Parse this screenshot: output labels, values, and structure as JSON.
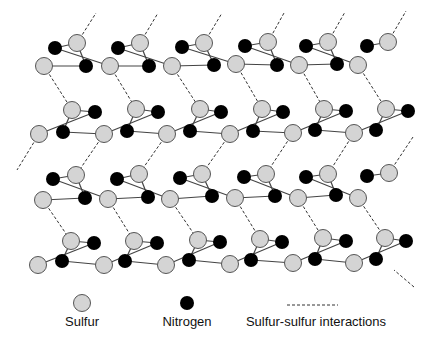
{
  "diagram": {
    "type": "molecular-lattice",
    "colors": {
      "sulfur_fill": "#d4d4d4",
      "sulfur_stroke": "#555555",
      "nitrogen_fill": "#000000",
      "bond": "#444444",
      "interaction": "#333333"
    },
    "radius": {
      "sulfur": 8.5,
      "nitrogen": 7
    },
    "rows": [
      {
        "s_top": [
          [
            77,
            43
          ],
          [
            140,
            43
          ],
          [
            204,
            43
          ],
          [
            268,
            42
          ],
          [
            328,
            42
          ],
          [
            388,
            42
          ]
        ],
        "n_top": [
          [
            55,
            48
          ],
          [
            118,
            48
          ],
          [
            182,
            47
          ],
          [
            245,
            46
          ],
          [
            306,
            46
          ],
          [
            367,
            46
          ]
        ],
        "s_bottom": [
          [
            44,
            66
          ],
          [
            110,
            66
          ],
          [
            172,
            66
          ],
          [
            236,
            64
          ],
          [
            299,
            65
          ],
          [
            358,
            65
          ]
        ],
        "n_bottom": [
          [
            86,
            66
          ],
          [
            149,
            66
          ],
          [
            214,
            65
          ],
          [
            277,
            65
          ],
          [
            337,
            64
          ]
        ]
      },
      {
        "s_top": [
          [
            72,
            110
          ],
          [
            136,
            109
          ],
          [
            200,
            109
          ],
          [
            262,
            109
          ],
          [
            324,
            109
          ],
          [
            386,
            109
          ]
        ],
        "n_top": [
          [
            95,
            112
          ],
          [
            158,
            112
          ],
          [
            221,
            112
          ],
          [
            283,
            112
          ],
          [
            346,
            111
          ],
          [
            408,
            111
          ]
        ],
        "s_bottom": [
          [
            39,
            134
          ],
          [
            104,
            134
          ],
          [
            167,
            134
          ],
          [
            230,
            134
          ],
          [
            293,
            133
          ],
          [
            354,
            133
          ]
        ],
        "n_bottom": [
          [
            63,
            132
          ],
          [
            127,
            131
          ],
          [
            190,
            131
          ],
          [
            253,
            131
          ],
          [
            315,
            130
          ],
          [
            376,
            130
          ]
        ]
      },
      {
        "s_top": [
          [
            76,
            175
          ],
          [
            139,
            174
          ],
          [
            202,
            174
          ],
          [
            266,
            174
          ],
          [
            328,
            174
          ],
          [
            389,
            173
          ]
        ],
        "n_top": [
          [
            53,
            179
          ],
          [
            117,
            179
          ],
          [
            180,
            178
          ],
          [
            244,
            177
          ],
          [
            306,
            177
          ],
          [
            367,
            176
          ]
        ],
        "s_bottom": [
          [
            43,
            200
          ],
          [
            108,
            199
          ],
          [
            170,
            199
          ],
          [
            235,
            198
          ],
          [
            298,
            198
          ],
          [
            358,
            198
          ]
        ],
        "n_bottom": [
          [
            85,
            198
          ],
          [
            148,
            197
          ],
          [
            212,
            196
          ],
          [
            275,
            196
          ],
          [
            336,
            195
          ]
        ]
      },
      {
        "s_top": [
          [
            71,
            241
          ],
          [
            134,
            241
          ],
          [
            198,
            240
          ],
          [
            260,
            239
          ],
          [
            323,
            238
          ],
          [
            385,
            238
          ]
        ],
        "n_top": [
          [
            94,
            243
          ],
          [
            157,
            243
          ],
          [
            220,
            242
          ],
          [
            282,
            242
          ],
          [
            346,
            241
          ],
          [
            406,
            241
          ]
        ],
        "s_bottom": [
          [
            38,
            265
          ],
          [
            104,
            265
          ],
          [
            166,
            265
          ],
          [
            230,
            264
          ],
          [
            293,
            263
          ],
          [
            354,
            263
          ]
        ],
        "n_bottom": [
          [
            62,
            261
          ],
          [
            125,
            261
          ],
          [
            189,
            260
          ],
          [
            251,
            260
          ],
          [
            315,
            259
          ],
          [
            376,
            259
          ]
        ]
      }
    ],
    "interactions": [
      [
        [
          77,
          43
        ],
        [
          96,
          13
        ]
      ],
      [
        [
          140,
          43
        ],
        [
          158,
          13
        ]
      ],
      [
        [
          204,
          43
        ],
        [
          222,
          13
        ]
      ],
      [
        [
          268,
          42
        ],
        [
          284,
          13
        ]
      ],
      [
        [
          328,
          42
        ],
        [
          345,
          12
        ]
      ],
      [
        [
          388,
          42
        ],
        [
          406,
          11
        ]
      ],
      [
        [
          44,
          66
        ],
        [
          72,
          110
        ]
      ],
      [
        [
          110,
          66
        ],
        [
          136,
          109
        ]
      ],
      [
        [
          172,
          66
        ],
        [
          200,
          109
        ]
      ],
      [
        [
          236,
          64
        ],
        [
          262,
          109
        ]
      ],
      [
        [
          299,
          65
        ],
        [
          324,
          109
        ]
      ],
      [
        [
          358,
          65
        ],
        [
          386,
          109
        ]
      ],
      [
        [
          39,
          134
        ],
        [
          17,
          170
        ]
      ],
      [
        [
          104,
          134
        ],
        [
          76,
          175
        ]
      ],
      [
        [
          167,
          134
        ],
        [
          139,
          174
        ]
      ],
      [
        [
          230,
          134
        ],
        [
          202,
          174
        ]
      ],
      [
        [
          293,
          133
        ],
        [
          266,
          174
        ]
      ],
      [
        [
          354,
          133
        ],
        [
          328,
          174
        ]
      ],
      [
        [
          413,
          137
        ],
        [
          389,
          173
        ]
      ],
      [
        [
          43,
          200
        ],
        [
          71,
          241
        ]
      ],
      [
        [
          108,
          199
        ],
        [
          134,
          241
        ]
      ],
      [
        [
          170,
          199
        ],
        [
          198,
          240
        ]
      ],
      [
        [
          235,
          198
        ],
        [
          260,
          239
        ]
      ],
      [
        [
          298,
          198
        ],
        [
          323,
          238
        ]
      ],
      [
        [
          358,
          198
        ],
        [
          385,
          238
        ]
      ],
      [
        [
          414,
          287
        ],
        [
          394,
          270
        ]
      ]
    ]
  },
  "legend": {
    "items": [
      {
        "label": "Sulfur",
        "symbol": "sulfur-circle",
        "x": 82
      },
      {
        "label": "Nitrogen",
        "symbol": "nitrogen-circle",
        "x": 187
      },
      {
        "label": "Sulfur-sulfur interactions",
        "symbol": "dashed-line",
        "x": 316
      }
    ]
  }
}
